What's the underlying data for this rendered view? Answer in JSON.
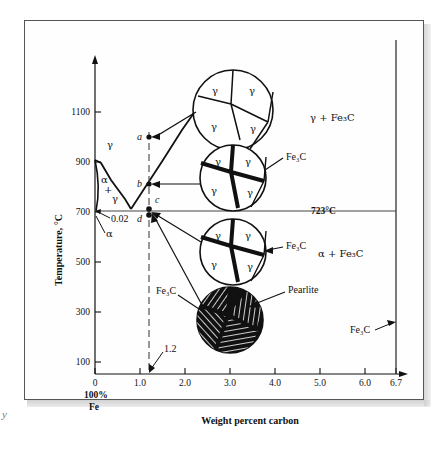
{
  "figure": {
    "margin_glyph": "y",
    "axes": {
      "x_title": "Weight percent carbon",
      "y_title": "Temperature, °C",
      "x_ticks": [
        "0",
        "1.0",
        "2.0",
        "3.0",
        "4.0",
        "5.0",
        "6.0",
        "6.7"
      ],
      "x_tick_values": [
        0,
        1.0,
        2.0,
        3.0,
        4.0,
        5.0,
        6.0,
        6.7
      ],
      "y_ticks": [
        "100",
        "300",
        "500",
        "700",
        "900",
        "1100"
      ],
      "y_tick_values": [
        100,
        300,
        500,
        700,
        900,
        1100
      ],
      "origin_label_1": "100%",
      "origin_label_2": "Fe"
    },
    "phase_labels": {
      "gamma": "γ",
      "alpha": "α",
      "alpha_plus_gamma_1": "α",
      "alpha_plus_gamma_plus": "+",
      "alpha_plus_gamma_2": "γ",
      "gamma_plus_fe3c": "γ + Fe₃C",
      "alpha_plus_fe3c": "α + Fe₃C",
      "eutectoid_temp": "723°C",
      "alpha_solubility": "0.02",
      "alloy_composition": "1.2",
      "cementite_line": "Fe₃C"
    },
    "cooling_points": [
      {
        "id": "a",
        "label": "a",
        "carbon": 1.2,
        "temp": 1030
      },
      {
        "id": "b",
        "label": "b",
        "carbon": 1.2,
        "temp": 840
      },
      {
        "id": "c",
        "label": "c",
        "carbon": 1.2,
        "temp": 745
      },
      {
        "id": "d",
        "label": "d",
        "carbon": 1.2,
        "temp": 700
      }
    ],
    "micrographs": [
      {
        "id": "micro-a",
        "caption": "",
        "grain_labels": [
          "γ",
          "γ",
          "γ",
          "γ"
        ],
        "boundary": "thin"
      },
      {
        "id": "micro-b",
        "caption": "Fe₃C",
        "grain_labels": [
          "γ",
          "γ",
          "γ",
          "γ"
        ],
        "boundary": "thick"
      },
      {
        "id": "micro-c",
        "caption": "Fe₃C",
        "grain_labels": [
          "γ",
          "γ",
          "γ",
          "γ"
        ],
        "boundary": "thick"
      },
      {
        "id": "micro-d",
        "caption": "Pearlite",
        "secondary_caption": "Fe₃C",
        "boundary": "lamellar"
      }
    ],
    "colors": {
      "ink": "#111111",
      "paper": "#fefefe",
      "frame": "#555555",
      "dashed": "#444444"
    }
  }
}
